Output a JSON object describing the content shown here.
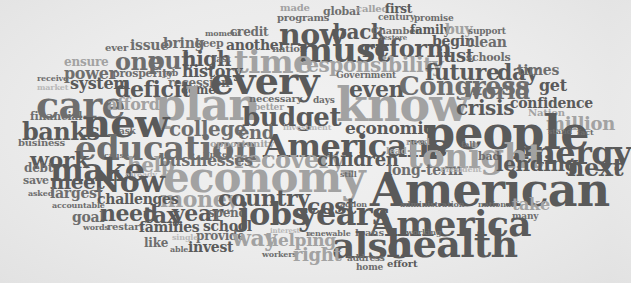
{
  "cloud": {
    "title": "Word cloud",
    "colors": {
      "dark": "#5a5a5a",
      "medium": "#6e6e6e",
      "light": "#a2a2a2",
      "faint": "#b8b8b8",
      "background": "#ececec"
    },
    "words": [
      {
        "text": "made",
        "x": 280,
        "y": 3,
        "size": 10,
        "tone": "l"
      },
      {
        "text": "global",
        "x": 323,
        "y": 6,
        "size": 11,
        "tone": "m"
      },
      {
        "text": "called",
        "x": 356,
        "y": 4,
        "size": 10,
        "tone": "l"
      },
      {
        "text": "first",
        "x": 385,
        "y": 3,
        "size": 12,
        "tone": "d"
      },
      {
        "text": "programs",
        "x": 277,
        "y": 13,
        "size": 10,
        "tone": "m"
      },
      {
        "text": "century",
        "x": 378,
        "y": 13,
        "size": 9,
        "tone": "m"
      },
      {
        "text": "promise",
        "x": 414,
        "y": 14,
        "size": 9,
        "tone": "m"
      },
      {
        "text": "moment",
        "x": 205,
        "y": 29,
        "size": 8,
        "tone": "m"
      },
      {
        "text": "credit",
        "x": 230,
        "y": 26,
        "size": 12,
        "tone": "m"
      },
      {
        "text": "now",
        "x": 279,
        "y": 20,
        "size": 30,
        "tone": "d"
      },
      {
        "text": "back",
        "x": 333,
        "y": 22,
        "size": 20,
        "tone": "d"
      },
      {
        "text": "Chamber",
        "x": 371,
        "y": 26,
        "size": 10,
        "tone": "m"
      },
      {
        "text": "family",
        "x": 410,
        "y": 24,
        "size": 12,
        "tone": "d"
      },
      {
        "text": "buy",
        "x": 445,
        "y": 22,
        "size": 14,
        "tone": "l"
      },
      {
        "text": "support",
        "x": 468,
        "y": 27,
        "size": 9,
        "tone": "m"
      },
      {
        "text": "ever",
        "x": 105,
        "y": 43,
        "size": 10,
        "tone": "m"
      },
      {
        "text": "issue",
        "x": 130,
        "y": 38,
        "size": 14,
        "tone": "m"
      },
      {
        "text": "bring",
        "x": 163,
        "y": 36,
        "size": 14,
        "tone": "m"
      },
      {
        "text": "keep",
        "x": 195,
        "y": 38,
        "size": 11,
        "tone": "m"
      },
      {
        "text": "another",
        "x": 226,
        "y": 38,
        "size": 14,
        "tone": "d"
      },
      {
        "text": "nation",
        "x": 272,
        "y": 44,
        "size": 10,
        "tone": "m"
      },
      {
        "text": "must",
        "x": 297,
        "y": 33,
        "size": 34,
        "tone": "d"
      },
      {
        "text": "reform",
        "x": 362,
        "y": 37,
        "size": 24,
        "tone": "d"
      },
      {
        "text": "restore",
        "x": 380,
        "y": 34,
        "size": 7,
        "tone": "m"
      },
      {
        "text": "begin",
        "x": 432,
        "y": 34,
        "size": 14,
        "tone": "d"
      },
      {
        "text": "clean",
        "x": 466,
        "y": 35,
        "size": 14,
        "tone": "m"
      },
      {
        "text": "ensure",
        "x": 64,
        "y": 56,
        "size": 12,
        "tone": "l"
      },
      {
        "text": "one",
        "x": 115,
        "y": 50,
        "size": 24,
        "tone": "m"
      },
      {
        "text": "put",
        "x": 148,
        "y": 49,
        "size": 24,
        "tone": "m"
      },
      {
        "text": "high",
        "x": 182,
        "y": 49,
        "size": 20,
        "tone": "d"
      },
      {
        "text": "last",
        "x": 213,
        "y": 55,
        "size": 9,
        "tone": "m"
      },
      {
        "text": "time",
        "x": 234,
        "y": 46,
        "size": 32,
        "tone": "l"
      },
      {
        "text": "responsibility",
        "x": 296,
        "y": 55,
        "size": 20,
        "tone": "l"
      },
      {
        "text": "just",
        "x": 437,
        "y": 47,
        "size": 18,
        "tone": "d"
      },
      {
        "text": "schools",
        "x": 466,
        "y": 52,
        "size": 11,
        "tone": "m"
      },
      {
        "text": "power",
        "x": 64,
        "y": 66,
        "size": 16,
        "tone": "m"
      },
      {
        "text": "prosperity",
        "x": 112,
        "y": 68,
        "size": 11,
        "tone": "m"
      },
      {
        "text": "job",
        "x": 163,
        "y": 69,
        "size": 9,
        "tone": "m"
      },
      {
        "text": "history",
        "x": 182,
        "y": 64,
        "size": 16,
        "tone": "d"
      },
      {
        "text": "future",
        "x": 425,
        "y": 61,
        "size": 22,
        "tone": "d"
      },
      {
        "text": "day",
        "x": 497,
        "y": 61,
        "size": 22,
        "tone": "d"
      },
      {
        "text": "times",
        "x": 517,
        "y": 63,
        "size": 14,
        "tone": "m"
      },
      {
        "text": "receive",
        "x": 37,
        "y": 74,
        "size": 8,
        "tone": "m"
      },
      {
        "text": "system",
        "x": 70,
        "y": 76,
        "size": 16,
        "tone": "d"
      },
      {
        "text": "recession",
        "x": 168,
        "y": 77,
        "size": 12,
        "tone": "m"
      },
      {
        "text": "every",
        "x": 210,
        "y": 62,
        "size": 38,
        "tone": "d"
      },
      {
        "text": "Government",
        "x": 336,
        "y": 71,
        "size": 9,
        "tone": "m"
      },
      {
        "text": "even",
        "x": 349,
        "y": 78,
        "size": 22,
        "tone": "d"
      },
      {
        "text": "Congress",
        "x": 399,
        "y": 73,
        "size": 26,
        "tone": "m"
      },
      {
        "text": "world",
        "x": 463,
        "y": 80,
        "size": 22,
        "tone": "m"
      },
      {
        "text": "get",
        "x": 539,
        "y": 78,
        "size": 16,
        "tone": "d"
      },
      {
        "text": "market",
        "x": 37,
        "y": 83,
        "size": 8,
        "tone": "xl"
      },
      {
        "text": "deficit",
        "x": 115,
        "y": 78,
        "size": 22,
        "tone": "d"
      },
      {
        "text": "come",
        "x": 181,
        "y": 84,
        "size": 12,
        "tone": "d"
      },
      {
        "text": "care",
        "x": 36,
        "y": 86,
        "size": 38,
        "tone": "m"
      },
      {
        "text": "plan",
        "x": 155,
        "y": 83,
        "size": 44,
        "tone": "l"
      },
      {
        "text": "necessary",
        "x": 249,
        "y": 94,
        "size": 10,
        "tone": "m"
      },
      {
        "text": "days",
        "x": 313,
        "y": 96,
        "size": 9,
        "tone": "m"
      },
      {
        "text": "know",
        "x": 336,
        "y": 82,
        "size": 46,
        "tone": "l"
      },
      {
        "text": "crisis",
        "x": 456,
        "y": 98,
        "size": 20,
        "tone": "d"
      },
      {
        "text": "afford",
        "x": 107,
        "y": 97,
        "size": 16,
        "tone": "l"
      },
      {
        "text": "confidence",
        "x": 510,
        "y": 96,
        "size": 14,
        "tone": "d"
      },
      {
        "text": "Nation",
        "x": 528,
        "y": 108,
        "size": 10,
        "tone": "l"
      },
      {
        "text": "financial",
        "x": 30,
        "y": 111,
        "size": 11,
        "tone": "m"
      },
      {
        "text": "new",
        "x": 82,
        "y": 103,
        "size": 40,
        "tone": "d"
      },
      {
        "text": "better",
        "x": 254,
        "y": 103,
        "size": 9,
        "tone": "l"
      },
      {
        "text": "budget",
        "x": 242,
        "y": 104,
        "size": 26,
        "tone": "d"
      },
      {
        "text": "million",
        "x": 546,
        "y": 115,
        "size": 18,
        "tone": "l"
      },
      {
        "text": "banks",
        "x": 22,
        "y": 120,
        "size": 24,
        "tone": "d"
      },
      {
        "text": "ask",
        "x": 119,
        "y": 127,
        "size": 9,
        "tone": "m"
      },
      {
        "text": "college",
        "x": 169,
        "y": 119,
        "size": 20,
        "tone": "m"
      },
      {
        "text": "end",
        "x": 238,
        "y": 124,
        "size": 18,
        "tone": "m"
      },
      {
        "text": "investment",
        "x": 283,
        "y": 123,
        "size": 8,
        "tone": "xl"
      },
      {
        "text": "economic",
        "x": 345,
        "y": 120,
        "size": 17,
        "tone": "d"
      },
      {
        "text": "people",
        "x": 423,
        "y": 110,
        "size": 46,
        "tone": "d"
      },
      {
        "text": "stand",
        "x": 548,
        "y": 127,
        "size": 8,
        "tone": "m"
      },
      {
        "text": "fact",
        "x": 577,
        "y": 128,
        "size": 8,
        "tone": "m"
      },
      {
        "text": "business",
        "x": 18,
        "y": 138,
        "size": 10,
        "tone": "m"
      },
      {
        "text": "education",
        "x": 75,
        "y": 131,
        "size": 34,
        "tone": "m"
      },
      {
        "text": "opportunity",
        "x": 210,
        "y": 139,
        "size": 10,
        "tone": "l"
      },
      {
        "text": "Americans",
        "x": 263,
        "y": 130,
        "size": 32,
        "tone": "d"
      },
      {
        "text": "need",
        "x": 406,
        "y": 138,
        "size": 9,
        "tone": "l"
      },
      {
        "text": "energy",
        "x": 513,
        "y": 137,
        "size": 32,
        "tone": "d"
      },
      {
        "text": "work",
        "x": 30,
        "y": 149,
        "size": 22,
        "tone": "d"
      },
      {
        "text": "cause",
        "x": 104,
        "y": 151,
        "size": 8,
        "tone": "m"
      },
      {
        "text": "recovery",
        "x": 234,
        "y": 148,
        "size": 24,
        "tone": "l"
      },
      {
        "text": "United",
        "x": 203,
        "y": 150,
        "size": 8,
        "tone": "m"
      },
      {
        "text": "children",
        "x": 317,
        "y": 151,
        "size": 18,
        "tone": "d"
      },
      {
        "text": "lead",
        "x": 386,
        "y": 147,
        "size": 9,
        "tone": "l"
      },
      {
        "text": "tonight",
        "x": 407,
        "y": 139,
        "size": 34,
        "tone": "l"
      },
      {
        "text": "fall",
        "x": 461,
        "y": 140,
        "size": 8,
        "tone": "m"
      },
      {
        "text": "bad",
        "x": 478,
        "y": 151,
        "size": 11,
        "tone": "m"
      },
      {
        "text": "help",
        "x": 127,
        "y": 155,
        "size": 20,
        "tone": "l"
      },
      {
        "text": "businesses",
        "x": 159,
        "y": 153,
        "size": 16,
        "tone": "m"
      },
      {
        "text": "lending",
        "x": 496,
        "y": 154,
        "size": 20,
        "tone": "d"
      },
      {
        "text": "next",
        "x": 567,
        "y": 156,
        "size": 24,
        "tone": "d"
      },
      {
        "text": "debt",
        "x": 24,
        "y": 162,
        "size": 12,
        "tone": "m"
      },
      {
        "text": "make",
        "x": 50,
        "y": 154,
        "size": 32,
        "tone": "d"
      },
      {
        "text": "already",
        "x": 125,
        "y": 170,
        "size": 8,
        "tone": "xl"
      },
      {
        "text": "long-term",
        "x": 387,
        "y": 163,
        "size": 14,
        "tone": "m"
      },
      {
        "text": "President",
        "x": 440,
        "y": 165,
        "size": 8,
        "tone": "xl"
      },
      {
        "text": "economy",
        "x": 163,
        "y": 157,
        "size": 42,
        "tone": "l"
      },
      {
        "text": "still",
        "x": 340,
        "y": 170,
        "size": 8,
        "tone": "m"
      },
      {
        "text": "American",
        "x": 370,
        "y": 167,
        "size": 46,
        "tone": "d"
      },
      {
        "text": "save",
        "x": 23,
        "y": 175,
        "size": 11,
        "tone": "m"
      },
      {
        "text": "meet",
        "x": 50,
        "y": 172,
        "size": 20,
        "tone": "d"
      },
      {
        "text": "Now",
        "x": 93,
        "y": 167,
        "size": 30,
        "tone": "d"
      },
      {
        "text": "money",
        "x": 160,
        "y": 188,
        "size": 22,
        "tone": "l"
      },
      {
        "text": "country",
        "x": 218,
        "y": 187,
        "size": 22,
        "tone": "d"
      },
      {
        "text": "cost",
        "x": 307,
        "y": 195,
        "size": 22,
        "tone": "d"
      },
      {
        "text": "action",
        "x": 340,
        "y": 200,
        "size": 8,
        "tone": "m"
      },
      {
        "text": "asked",
        "x": 28,
        "y": 189,
        "size": 8,
        "tone": "m"
      },
      {
        "text": "largest",
        "x": 50,
        "y": 186,
        "size": 14,
        "tone": "m"
      },
      {
        "text": "challenges",
        "x": 97,
        "y": 192,
        "size": 14,
        "tone": "d"
      },
      {
        "text": "administration",
        "x": 400,
        "y": 200,
        "size": 8,
        "tone": "m"
      },
      {
        "text": "national",
        "x": 478,
        "y": 200,
        "size": 8,
        "tone": "m"
      },
      {
        "text": "take",
        "x": 512,
        "y": 197,
        "size": 16,
        "tone": "l"
      },
      {
        "text": "accountable",
        "x": 52,
        "y": 201,
        "size": 8,
        "tone": "m"
      },
      {
        "text": "many",
        "x": 512,
        "y": 212,
        "size": 9,
        "tone": "m"
      },
      {
        "text": "goal",
        "x": 72,
        "y": 210,
        "size": 14,
        "tone": "m"
      },
      {
        "text": "need",
        "x": 100,
        "y": 202,
        "size": 22,
        "tone": "d"
      },
      {
        "text": "tax",
        "x": 143,
        "y": 204,
        "size": 22,
        "tone": "d"
      },
      {
        "text": "year",
        "x": 172,
        "y": 202,
        "size": 22,
        "tone": "d"
      },
      {
        "text": "spend",
        "x": 208,
        "y": 207,
        "size": 12,
        "tone": "m"
      },
      {
        "text": "jobs",
        "x": 238,
        "y": 198,
        "size": 32,
        "tone": "d"
      },
      {
        "text": "years",
        "x": 298,
        "y": 198,
        "size": 32,
        "tone": "d"
      },
      {
        "text": "America",
        "x": 369,
        "y": 205,
        "size": 36,
        "tone": "d"
      },
      {
        "text": "school",
        "x": 203,
        "y": 219,
        "size": 14,
        "tone": "d"
      },
      {
        "text": "words",
        "x": 83,
        "y": 223,
        "size": 8,
        "tone": "m"
      },
      {
        "text": "restart",
        "x": 107,
        "y": 222,
        "size": 10,
        "tone": "m"
      },
      {
        "text": "families",
        "x": 139,
        "y": 220,
        "size": 14,
        "tone": "d"
      },
      {
        "text": "working",
        "x": 406,
        "y": 228,
        "size": 8,
        "tone": "m"
      },
      {
        "text": "provide",
        "x": 196,
        "y": 230,
        "size": 12,
        "tone": "m"
      },
      {
        "text": "way",
        "x": 232,
        "y": 227,
        "size": 22,
        "tone": "l"
      },
      {
        "text": "interest",
        "x": 270,
        "y": 227,
        "size": 7,
        "tone": "xl"
      },
      {
        "text": "helping",
        "x": 266,
        "y": 232,
        "size": 17,
        "tone": "l"
      },
      {
        "text": "renewable",
        "x": 306,
        "y": 229,
        "size": 8,
        "tone": "m"
      },
      {
        "text": "loans",
        "x": 355,
        "y": 228,
        "size": 10,
        "tone": "m"
      },
      {
        "text": "also",
        "x": 332,
        "y": 227,
        "size": 36,
        "tone": "d"
      },
      {
        "text": "health",
        "x": 386,
        "y": 225,
        "size": 38,
        "tone": "d"
      },
      {
        "text": "like",
        "x": 144,
        "y": 237,
        "size": 12,
        "tone": "m"
      },
      {
        "text": "single",
        "x": 172,
        "y": 233,
        "size": 8,
        "tone": "xl"
      },
      {
        "text": "able",
        "x": 170,
        "y": 245,
        "size": 8,
        "tone": "m"
      },
      {
        "text": "invest",
        "x": 188,
        "y": 240,
        "size": 14,
        "tone": "d"
      },
      {
        "text": "workers",
        "x": 262,
        "y": 250,
        "size": 8,
        "tone": "m"
      },
      {
        "text": "right",
        "x": 293,
        "y": 246,
        "size": 18,
        "tone": "l"
      },
      {
        "text": "address",
        "x": 347,
        "y": 254,
        "size": 9,
        "tone": "m"
      },
      {
        "text": "effort",
        "x": 387,
        "y": 259,
        "size": 10,
        "tone": "d"
      },
      {
        "text": "home",
        "x": 356,
        "y": 263,
        "size": 9,
        "tone": "m"
      }
    ]
  }
}
